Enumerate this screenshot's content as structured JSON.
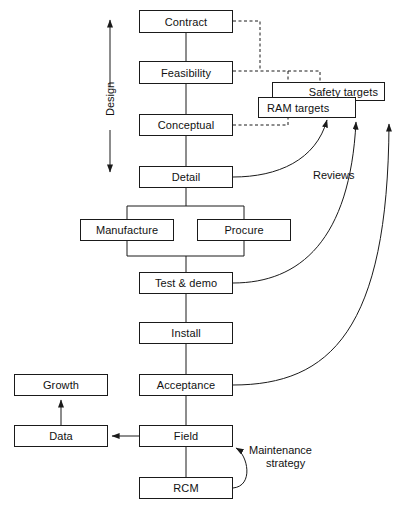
{
  "diagram": {
    "stroke_color": "#1a1a1a",
    "text_color": "#111111",
    "background_color": "#ffffff",
    "nodes": [
      {
        "id": "contract",
        "label": "Contract",
        "x": 139,
        "y": 10,
        "w": 94,
        "h": 23
      },
      {
        "id": "feasibility",
        "label": "Feasibility",
        "x": 139,
        "y": 61,
        "w": 94,
        "h": 23
      },
      {
        "id": "safety_targets",
        "label": "Safety targets",
        "x": 272,
        "y": 82,
        "w": 113,
        "h": 19
      },
      {
        "id": "ram_targets",
        "label": "RAM targets",
        "x": 258,
        "y": 97,
        "w": 98,
        "h": 21
      },
      {
        "id": "conceptual",
        "label": "Conceptual",
        "x": 139,
        "y": 114,
        "w": 94,
        "h": 22
      },
      {
        "id": "detail",
        "label": "Detail",
        "x": 139,
        "y": 166,
        "w": 94,
        "h": 22
      },
      {
        "id": "manufacture",
        "label": "Manufacture",
        "x": 80,
        "y": 219,
        "w": 94,
        "h": 22
      },
      {
        "id": "procure",
        "label": "Procure",
        "x": 197,
        "y": 219,
        "w": 94,
        "h": 22
      },
      {
        "id": "test_demo",
        "label": "Test & demo",
        "x": 139,
        "y": 272,
        "w": 94,
        "h": 22
      },
      {
        "id": "install",
        "label": "Install",
        "x": 139,
        "y": 322,
        "w": 94,
        "h": 22
      },
      {
        "id": "growth",
        "label": "Growth",
        "x": 14,
        "y": 374,
        "w": 94,
        "h": 22
      },
      {
        "id": "acceptance",
        "label": "Acceptance",
        "x": 139,
        "y": 374,
        "w": 94,
        "h": 22
      },
      {
        "id": "data",
        "label": "Data",
        "x": 14,
        "y": 425,
        "w": 94,
        "h": 22
      },
      {
        "id": "field",
        "label": "Field",
        "x": 139,
        "y": 425,
        "w": 94,
        "h": 22
      },
      {
        "id": "rcm",
        "label": "RCM",
        "x": 139,
        "y": 477,
        "w": 94,
        "h": 22
      }
    ],
    "labels": [
      {
        "id": "design",
        "text": "Design",
        "x": 104,
        "y": 113,
        "rotated": true
      },
      {
        "id": "reviews",
        "text": "Reviews",
        "x": 313,
        "y": 169,
        "rotated": false
      },
      {
        "id": "maintenance_strategy_line1",
        "text": "Maintenance",
        "x": 252,
        "y": 446,
        "rotated": false
      },
      {
        "id": "maintenance_strategy_line2",
        "text": "strategy",
        "x": 266,
        "y": 459,
        "rotated": false
      }
    ],
    "connector_kinds": {
      "solid": "solid-connector",
      "dashed": "dashed-target-link",
      "curved_arrow": "curved-review-arrow",
      "double_arrow": "double-headed-design-arrow"
    }
  }
}
